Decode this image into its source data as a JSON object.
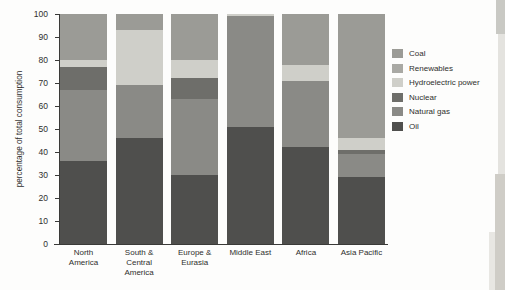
{
  "chart_data": {
    "type": "bar",
    "subtype": "stacked-bar-100",
    "title": "",
    "xlabel": "",
    "ylabel": "percentage of total consumption",
    "ylim": [
      0,
      100
    ],
    "yticks": [
      0,
      10,
      20,
      30,
      40,
      50,
      60,
      70,
      80,
      90,
      100
    ],
    "grid": false,
    "legend_position": "right",
    "categories": [
      "North\nAmerica",
      "South  & Central\nAmerica",
      "Europe &\nEurasia",
      "Middle East",
      "Africa",
      "Asia Pacific"
    ],
    "category_labels_flat": [
      "North America",
      "South & Central America",
      "Europe & Eurasia",
      "Middle East",
      "Africa",
      "Asia Pacific"
    ],
    "series": [
      {
        "name": "Oil",
        "color": "#4f4f4d",
        "values": [
          36,
          46,
          30,
          51,
          42,
          29
        ]
      },
      {
        "name": "Natural gas",
        "color": "#8a8a86",
        "values": [
          31,
          23,
          33,
          48,
          29,
          10
        ]
      },
      {
        "name": "Nuclear",
        "color": "#6e6e6a",
        "values": [
          10,
          0,
          9,
          0,
          0,
          2
        ]
      },
      {
        "name": "Hydroelectric power",
        "color": "#cfcfc9",
        "values": [
          3,
          24,
          8,
          1,
          7,
          5
        ]
      },
      {
        "name": "Renewables",
        "color": "#a9a9a4",
        "values": [
          0,
          0,
          0,
          0,
          0,
          0
        ]
      },
      {
        "name": "Coal",
        "color": "#9b9b96",
        "values": [
          20,
          7,
          20,
          0,
          22,
          54
        ]
      }
    ]
  },
  "legend": {
    "items": [
      {
        "label": "Coal",
        "color": "#9b9b96"
      },
      {
        "label": "Renewables",
        "color": "#a9a9a4"
      },
      {
        "label": "Hydroelectric power",
        "color": "#cfcfc9"
      },
      {
        "label": "Nuclear",
        "color": "#6e6e6a"
      },
      {
        "label": "Natural gas",
        "color": "#8a8a86"
      },
      {
        "label": "Oil",
        "color": "#4f4f4d"
      }
    ]
  }
}
